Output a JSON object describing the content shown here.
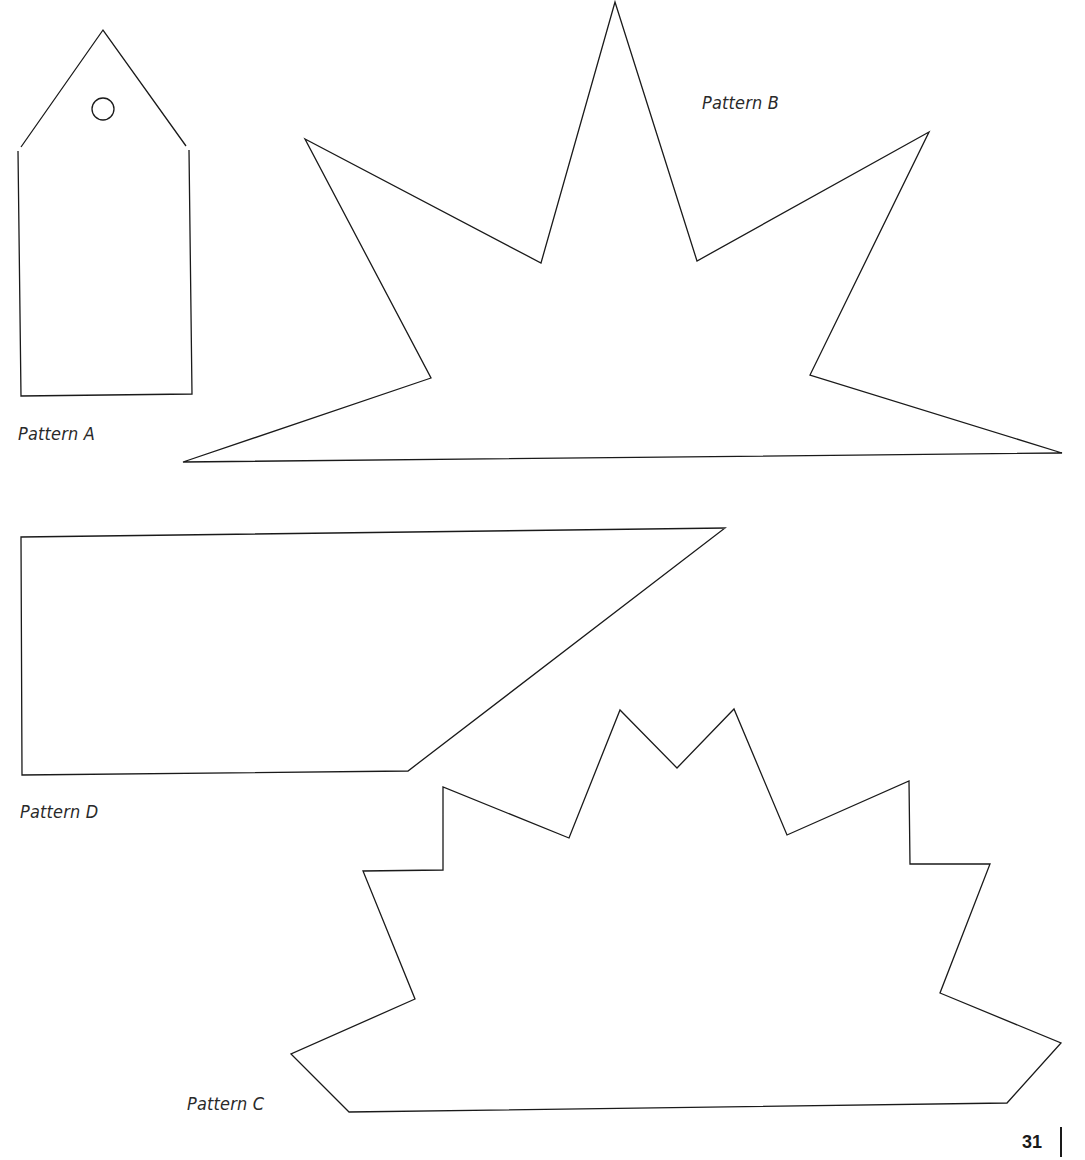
{
  "page": {
    "number": "31",
    "background": "#ffffff",
    "stroke_color": "#1a1a1a"
  },
  "patterns": [
    {
      "id": "A",
      "label": "Pattern A",
      "shape": "gift tag (pentagon with punched hole)",
      "label_pos": [
        18,
        424
      ]
    },
    {
      "id": "B",
      "label": "Pattern B",
      "shape": "starburst half (flat base, 5 points)",
      "label_pos": [
        702,
        93
      ]
    },
    {
      "id": "C",
      "label": "Pattern C",
      "shape": "jagged crown / sunburst half with flat base",
      "label_pos": [
        187,
        1094
      ]
    },
    {
      "id": "D",
      "label": "Pattern D",
      "shape": "trapezoid banner with slanted right edge",
      "label_pos": [
        20,
        802
      ]
    }
  ]
}
